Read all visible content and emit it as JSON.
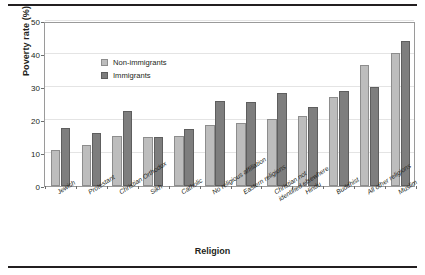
{
  "chart_data": {
    "type": "bar",
    "title": "",
    "xlabel": "Religion",
    "ylabel": "Poverty rate (%)",
    "ylim": [
      0,
      50
    ],
    "yticks": [
      0,
      10,
      20,
      30,
      40,
      50
    ],
    "grid": true,
    "legend_position": "top-left",
    "categories": [
      "Jewish",
      "Protestant",
      "Christian Orthodox",
      "Sikh",
      "Catholic",
      "No religious affiliation",
      "Eastern religions",
      "Christian not identified elsewhere",
      "Hindu",
      "Buddhist",
      "All other religions",
      "Muslim"
    ],
    "series": [
      {
        "name": "Non-immigrants",
        "color": "#bdbdbd",
        "values": [
          10.9,
          12.3,
          15.2,
          15.0,
          15.3,
          18.5,
          19.1,
          20.3,
          21.2,
          26.9,
          36.8,
          40.4
        ]
      },
      {
        "name": "Immigrants",
        "color": "#7e7e7e",
        "values": [
          17.5,
          16.0,
          22.8,
          15.0,
          17.3,
          25.8,
          25.4,
          28.1,
          23.9,
          28.8,
          30.0,
          43.9
        ]
      }
    ]
  },
  "axis": {
    "y_title": "Poverty rate (%)",
    "x_title": "Religion",
    "y_tick_labels": [
      "0",
      "10",
      "20",
      "30",
      "40",
      "50"
    ]
  },
  "legend": {
    "items": [
      {
        "label": "Non-immigrants"
      },
      {
        "label": "Immigrants"
      }
    ]
  }
}
